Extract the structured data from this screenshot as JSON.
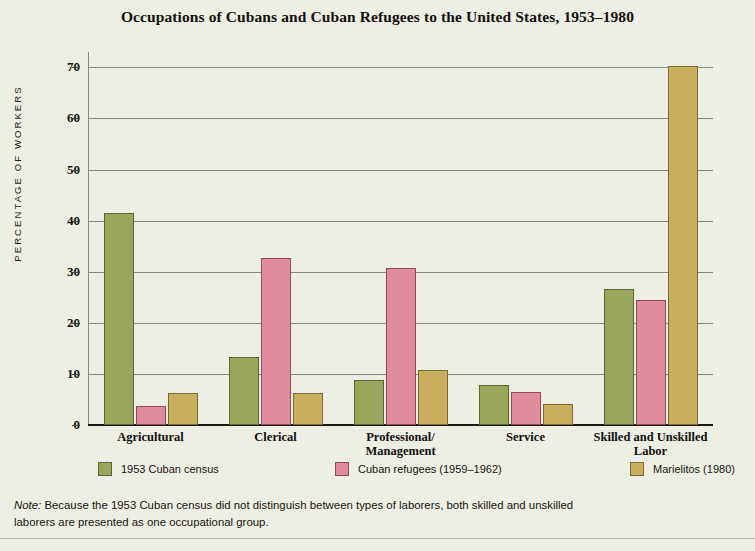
{
  "chart_data": {
    "type": "bar",
    "title": "Occupations of Cubans and Cuban Refugees to the United States, 1953–1980",
    "xlabel": "",
    "ylabel": "PERCENTAGE OF WORKERS",
    "ylim": [
      0,
      73
    ],
    "yticks": [
      0,
      10,
      20,
      30,
      40,
      50,
      60,
      70
    ],
    "ytick_labels": [
      "0",
      "10",
      "20",
      "30",
      "40",
      "50",
      "60",
      "70"
    ],
    "grid": true,
    "legend_position": "bottom",
    "categories": [
      "Agricultural",
      "Clerical",
      "Professional/\nManagement",
      "Service",
      "Skilled and Unskilled\nLabor"
    ],
    "series": [
      {
        "name": "1953 Cuban census",
        "color": "#9aa65c",
        "values": [
          41.5,
          13.3,
          8.8,
          7.8,
          26.7
        ]
      },
      {
        "name": "Cuban refugees (1959–1962)",
        "color": "#e08b9e",
        "values": [
          3.8,
          32.7,
          30.7,
          6.4,
          24.4
        ]
      },
      {
        "name": "Marielitos (1980)",
        "color": "#c9ae5e",
        "values": [
          6.2,
          6.2,
          10.7,
          4.2,
          70.3
        ]
      }
    ],
    "note_label": "Note:",
    "note_text": " Because the 1953 Cuban census did not distinguish between types of laborers, both skilled and unskilled laborers are presented as one occupational group.",
    "background_color": "#edeee4"
  },
  "categories_display": [
    {
      "line1": "Agricultural",
      "line2": ""
    },
    {
      "line1": "Clerical",
      "line2": ""
    },
    {
      "line1": "Professional/",
      "line2": "Management"
    },
    {
      "line1": "Service",
      "line2": ""
    },
    {
      "line1": "Skilled and Unskilled",
      "line2": "Labor"
    }
  ]
}
